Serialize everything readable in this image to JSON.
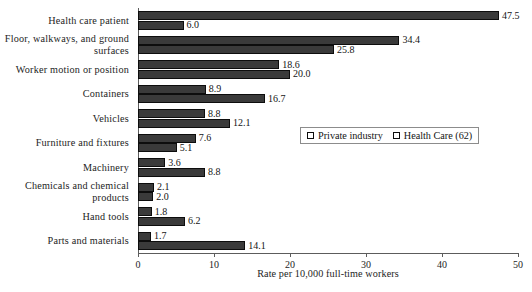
{
  "chart_data": {
    "type": "bar",
    "orientation": "horizontal",
    "title": "",
    "xlabel": "Rate per 10,000 full-time workers",
    "ylabel": "",
    "xlim": [
      0,
      50
    ],
    "xticks": [
      0,
      10,
      20,
      30,
      40,
      50
    ],
    "grid": false,
    "legend_position": "center-right",
    "categories": [
      "Health care patient",
      "Floor, walkways, and ground surfaces",
      "Worker motion or position",
      "Containers",
      "Vehicles",
      "Furniture and fixtures",
      "Machinery",
      "Chemicals and chemical products",
      "Hand tools",
      "Parts and materials"
    ],
    "series": [
      {
        "name": "Private industry",
        "values": [
          6.0,
          25.8,
          20.0,
          16.7,
          12.1,
          5.1,
          8.8,
          2.0,
          6.2,
          14.1
        ]
      },
      {
        "name": "Health Care (62)",
        "values": [
          47.5,
          34.4,
          18.6,
          8.9,
          8.8,
          7.6,
          3.6,
          2.1,
          1.8,
          1.7
        ]
      }
    ],
    "value_labels": {
      "Private industry": [
        "6.0",
        "25.8",
        "20.0",
        "16.7",
        "12.1",
        "5.1",
        "8.8",
        "2.0",
        "6.2",
        "14.1"
      ],
      "Health Care (62)": [
        "47.5",
        "34.4",
        "18.6",
        "8.9",
        "8.8",
        "7.6",
        "3.6",
        "2.1",
        "1.8",
        "1.7"
      ]
    },
    "colors": {
      "Private industry": "#3a3a3a",
      "Health Care (62)": "#3a3a3a",
      "axis": "#5c5c5c",
      "background": "#ffffff"
    }
  },
  "legend": {
    "entries": [
      {
        "label": "Private industry"
      },
      {
        "label": "Health Care (62)"
      }
    ]
  },
  "axis": {
    "x_title": "Rate per 10,000 full-time workers",
    "tick_labels": [
      "0",
      "10",
      "20",
      "30",
      "40",
      "50"
    ]
  }
}
